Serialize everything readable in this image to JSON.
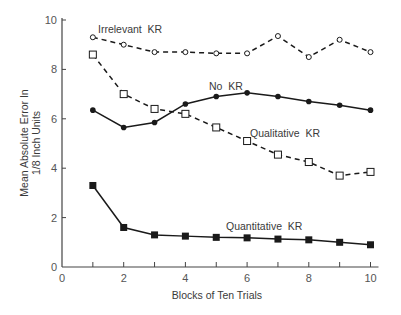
{
  "chart_data": {
    "type": "line",
    "title": "",
    "xlabel": "Blocks of Ten Trials",
    "ylabel": [
      "Mean Absolute Error In",
      "1/8 Inch Units"
    ],
    "xlim": [
      0,
      10
    ],
    "ylim": [
      0,
      10
    ],
    "x_ticks": [
      0,
      2,
      4,
      6,
      8,
      10
    ],
    "x_minor_ticks": [
      1,
      3,
      5,
      7,
      9
    ],
    "y_ticks": [
      0,
      2,
      4,
      6,
      8,
      10
    ],
    "grid": false,
    "legend": "inline labels",
    "x": [
      1,
      2,
      3,
      4,
      5,
      6,
      7,
      8,
      9,
      10
    ],
    "series": [
      {
        "name": "Irrelevant KR",
        "line": "dashed",
        "marker": "open-circle",
        "values": [
          9.3,
          9.0,
          8.7,
          8.7,
          8.65,
          8.65,
          9.35,
          8.5,
          9.2,
          8.7
        ],
        "label_pos": [
          98,
          33
        ]
      },
      {
        "name": "No KR",
        "line": "solid",
        "marker": "filled-circle",
        "values": [
          6.35,
          5.65,
          5.85,
          6.6,
          6.9,
          7.05,
          6.9,
          6.7,
          6.55,
          6.35
        ],
        "label_pos": [
          209,
          90
        ]
      },
      {
        "name": "Qualitative KR",
        "line": "dashed",
        "marker": "open-square",
        "values": [
          8.6,
          7.0,
          6.4,
          6.2,
          5.65,
          5.1,
          4.55,
          4.25,
          3.7,
          3.85
        ],
        "label_pos": [
          250,
          137
        ]
      },
      {
        "name": "Quantitative KR",
        "line": "solid",
        "marker": "filled-square",
        "values": [
          3.3,
          1.6,
          1.3,
          1.25,
          1.2,
          1.18,
          1.13,
          1.1,
          1.0,
          0.9
        ],
        "label_pos": [
          226,
          230
        ]
      }
    ]
  },
  "colors": {
    "line": "#1a1a1a",
    "axis": "#444444",
    "text": "#3a3a3a",
    "background": "#ffffff"
  }
}
